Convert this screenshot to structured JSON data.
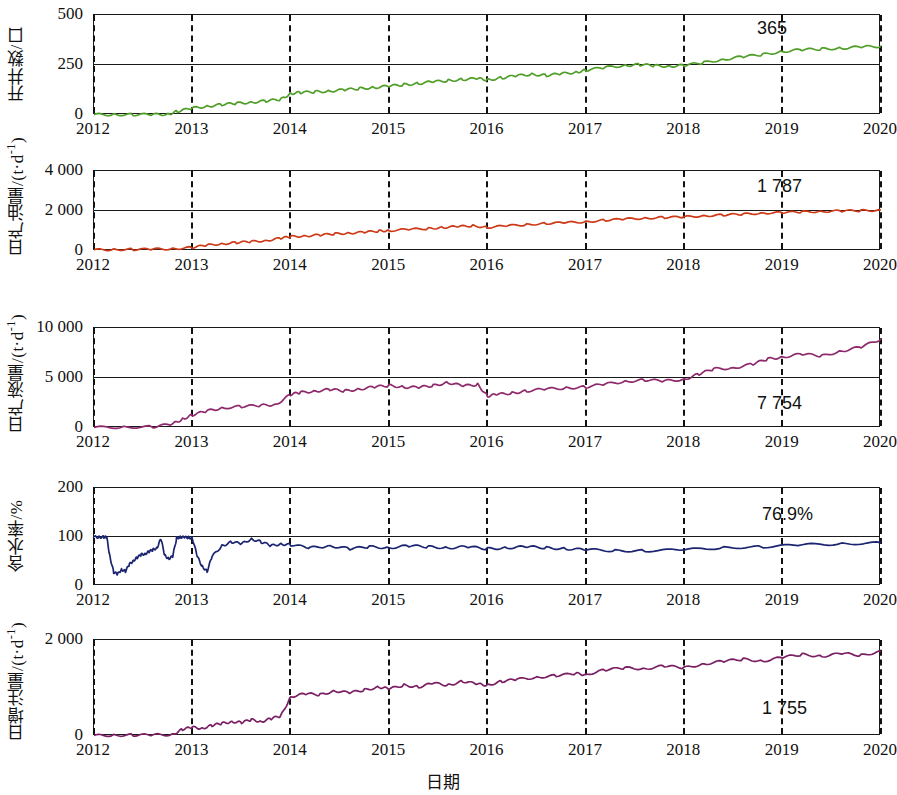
{
  "chart_data": {
    "type": "line",
    "title": "",
    "xlabel": "日期",
    "x_ticks": [
      "2012",
      "2013",
      "2014",
      "2015",
      "2016",
      "2017",
      "2018",
      "2019",
      "2020"
    ],
    "xlim": [
      2012,
      2020
    ],
    "grid": true,
    "legend": "none",
    "panels": [
      {
        "id": "wells",
        "ylabel": "开井数/口",
        "ylim": [
          0,
          500
        ],
        "y_ticks": [
          "0",
          "250",
          "500"
        ],
        "y_tick_values": [
          0,
          250,
          500
        ],
        "annotation": "365",
        "annotation_x": 2018.75,
        "annotation_y": 430,
        "color": "#4f9e28",
        "series": [
          {
            "name": "开井数",
            "x": [
              2012.0,
              2012.2,
              2012.4,
              2012.6,
              2012.75,
              2012.85,
              2013.0,
              2013.15,
              2013.3,
              2013.45,
              2013.6,
              2013.75,
              2013.9,
              2014.0,
              2014.1,
              2014.25,
              2014.4,
              2014.55,
              2014.7,
              2014.85,
              2015.0,
              2015.15,
              2015.3,
              2015.45,
              2015.6,
              2015.75,
              2015.9,
              2016.0,
              2016.15,
              2016.3,
              2016.45,
              2016.6,
              2016.75,
              2016.9,
              2017.0,
              2017.2,
              2017.4,
              2017.55,
              2017.7,
              2017.85,
              2018.0,
              2018.2,
              2018.4,
              2018.6,
              2018.8,
              2019.0,
              2019.2,
              2019.4,
              2019.6,
              2019.8,
              2020.0
            ],
            "y": [
              2,
              2,
              2,
              2,
              4,
              18,
              34,
              44,
              52,
              58,
              64,
              70,
              78,
              108,
              112,
              116,
              120,
              126,
              132,
              138,
              144,
              152,
              158,
              166,
              172,
              178,
              182,
              176,
              186,
              196,
              204,
              198,
              206,
              214,
              224,
              238,
              248,
              252,
              246,
              244,
              248,
              262,
              278,
              292,
              302,
              318,
              326,
              330,
              334,
              340,
              344
            ]
          }
        ]
      },
      {
        "id": "oil",
        "ylabel": "日产油量/(t·d⁻¹)",
        "ylim": [
          0,
          4000
        ],
        "y_ticks": [
          "0",
          "2 000",
          "4 000"
        ],
        "y_tick_values": [
          0,
          2000,
          4000
        ],
        "annotation": "1 787",
        "annotation_x": 2018.75,
        "annotation_y": 3180,
        "color": "#cc3a17",
        "series": [
          {
            "name": "日产油量",
            "x": [
              2012.0,
              2012.2,
              2012.4,
              2012.6,
              2012.8,
              2013.0,
              2013.15,
              2013.3,
              2013.45,
              2013.6,
              2013.75,
              2013.9,
              2014.0,
              2014.15,
              2014.3,
              2014.45,
              2014.6,
              2014.75,
              2014.9,
              2015.0,
              2015.2,
              2015.4,
              2015.55,
              2015.7,
              2015.85,
              2016.0,
              2016.2,
              2016.4,
              2016.6,
              2016.8,
              2017.0,
              2017.2,
              2017.4,
              2017.6,
              2017.8,
              2018.0,
              2018.2,
              2018.4,
              2018.6,
              2018.8,
              2019.0,
              2019.2,
              2019.4,
              2019.6,
              2019.8,
              2020.0
            ],
            "y": [
              60,
              70,
              80,
              90,
              110,
              180,
              290,
              360,
              420,
              470,
              520,
              640,
              720,
              760,
              800,
              860,
              900,
              940,
              1000,
              1020,
              1080,
              1120,
              1180,
              1220,
              1260,
              1180,
              1260,
              1320,
              1380,
              1420,
              1460,
              1540,
              1600,
              1640,
              1680,
              1700,
              1760,
              1800,
              1840,
              1900,
              1920,
              1960,
              1980,
              2000,
              2020,
              2040
            ]
          }
        ]
      },
      {
        "id": "liquid",
        "ylabel": "日产液量/(t·d⁻¹)",
        "ylim": [
          0,
          10000
        ],
        "y_ticks": [
          "0",
          "5 000",
          "10 000"
        ],
        "y_tick_values": [
          0,
          5000,
          10000
        ],
        "annotation": "7 754",
        "annotation_x": 2018.75,
        "annotation_y": 2450,
        "color": "#8e2a6b",
        "series": [
          {
            "name": "日产液量",
            "x": [
              2012.0,
              2012.3,
              2012.6,
              2012.8,
              2012.9,
              2013.0,
              2013.15,
              2013.3,
              2013.5,
              2013.7,
              2013.85,
              2014.0,
              2014.1,
              2014.25,
              2014.4,
              2014.55,
              2014.7,
              2014.85,
              2015.0,
              2015.15,
              2015.3,
              2015.45,
              2015.6,
              2015.75,
              2015.9,
              2016.0,
              2016.1,
              2016.25,
              2016.4,
              2016.6,
              2016.8,
              2017.0,
              2017.2,
              2017.4,
              2017.6,
              2017.8,
              2018.0,
              2018.15,
              2018.3,
              2018.5,
              2018.7,
              2018.85,
              2019.0,
              2019.2,
              2019.4,
              2019.6,
              2019.8,
              2020.0
            ],
            "y": [
              60,
              80,
              120,
              400,
              900,
              1300,
              1700,
              2000,
              2150,
              2250,
              2350,
              3350,
              3550,
              3700,
              3850,
              3700,
              3900,
              4100,
              4250,
              4100,
              4050,
              4250,
              4550,
              4200,
              4350,
              3200,
              3350,
              3500,
              3700,
              3900,
              4000,
              4100,
              4400,
              4650,
              4800,
              4700,
              4850,
              5400,
              5900,
              6000,
              6400,
              6900,
              7100,
              7400,
              7200,
              7700,
              8100,
              8900
            ]
          }
        ]
      },
      {
        "id": "watercut",
        "ylabel": "含水率/%",
        "ylim": [
          0,
          200
        ],
        "y_ticks": [
          "0",
          "100",
          "200"
        ],
        "y_tick_values": [
          0,
          100,
          200
        ],
        "annotation": "76.9%",
        "annotation_x": 2018.8,
        "annotation_y": 145,
        "color": "#1b2470",
        "series": [
          {
            "name": "含水率",
            "x": [
              2012.0,
              2012.05,
              2012.1,
              2012.13,
              2012.16,
              2012.2,
              2012.24,
              2012.28,
              2012.32,
              2012.36,
              2012.4,
              2012.44,
              2012.48,
              2012.52,
              2012.56,
              2012.6,
              2012.64,
              2012.68,
              2012.72,
              2012.76,
              2012.8,
              2012.84,
              2012.88,
              2012.92,
              2012.96,
              2013.0,
              2013.05,
              2013.1,
              2013.15,
              2013.2,
              2013.3,
              2013.4,
              2013.5,
              2013.6,
              2013.7,
              2013.8,
              2013.9,
              2014.0,
              2014.2,
              2014.4,
              2014.6,
              2014.8,
              2015.0,
              2015.2,
              2015.4,
              2015.6,
              2015.8,
              2016.0,
              2016.2,
              2016.4,
              2016.6,
              2016.8,
              2017.0,
              2017.3,
              2017.6,
              2018.0,
              2018.4,
              2018.8,
              2019.2,
              2019.6,
              2020.0
            ],
            "y": [
              100,
              100,
              100,
              99,
              62,
              28,
              24,
              34,
              30,
              44,
              52,
              58,
              64,
              66,
              70,
              74,
              78,
              96,
              62,
              56,
              60,
              98,
              100,
              99,
              99,
              98,
              60,
              40,
              30,
              60,
              82,
              90,
              86,
              96,
              90,
              82,
              86,
              84,
              78,
              82,
              76,
              80,
              78,
              82,
              80,
              78,
              80,
              76,
              78,
              80,
              78,
              76,
              74,
              72,
              72,
              74,
              78,
              80,
              84,
              86,
              88
            ]
          }
        ]
      },
      {
        "id": "injection",
        "ylabel": "日增注量/(t·d⁻¹)",
        "ylim": [
          0,
          2000
        ],
        "y_ticks": [
          "0",
          "2 000"
        ],
        "y_tick_values": [
          0,
          2000
        ],
        "annotation": "1 755",
        "annotation_x": 2018.8,
        "annotation_y": 560,
        "color": "#7a1f63",
        "series": [
          {
            "name": "日增注量",
            "x": [
              2012.0,
              2012.2,
              2012.4,
              2012.6,
              2012.8,
              2012.9,
              2013.0,
              2013.1,
              2013.2,
              2013.3,
              2013.4,
              2013.5,
              2013.6,
              2013.7,
              2013.8,
              2013.9,
              2014.0,
              2014.15,
              2014.3,
              2014.45,
              2014.6,
              2014.75,
              2014.9,
              2015.0,
              2015.15,
              2015.3,
              2015.45,
              2015.6,
              2015.75,
              2015.9,
              2016.0,
              2016.15,
              2016.3,
              2016.5,
              2016.7,
              2016.9,
              2017.0,
              2017.2,
              2017.4,
              2017.6,
              2017.8,
              2018.0,
              2018.2,
              2018.4,
              2018.6,
              2018.8,
              2019.0,
              2019.2,
              2019.4,
              2019.6,
              2019.8,
              2020.0
            ],
            "y": [
              10,
              15,
              20,
              22,
              30,
              140,
              180,
              160,
              220,
              260,
              300,
              280,
              340,
              300,
              360,
              420,
              820,
              880,
              860,
              940,
              900,
              960,
              1020,
              980,
              1060,
              1020,
              1100,
              1060,
              1140,
              1080,
              1060,
              1140,
              1180,
              1220,
              1260,
              1300,
              1280,
              1380,
              1420,
              1400,
              1460,
              1420,
              1500,
              1560,
              1600,
              1560,
              1640,
              1700,
              1660,
              1720,
              1680,
              1760
            ]
          }
        ]
      }
    ]
  },
  "layout": {
    "plot_left": 93,
    "plot_right": 880,
    "panel_tops": [
      14,
      170,
      327,
      487,
      639
    ],
    "panel_heights": [
      100,
      80,
      100,
      98,
      96
    ],
    "xtick_offsets": [
      118,
      288,
      447,
      610,
      773,
      930,
      1091,
      1254,
      1412
    ]
  }
}
